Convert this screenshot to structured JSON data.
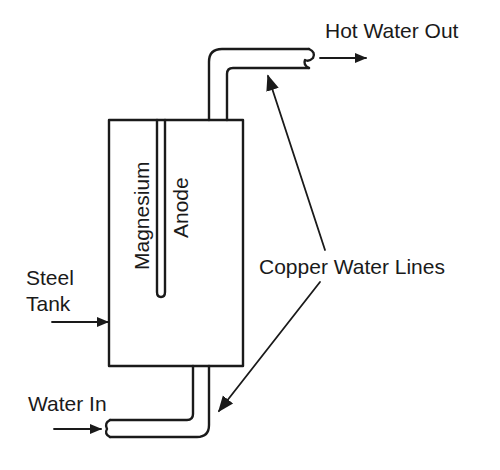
{
  "diagram": {
    "labels": {
      "hot_water_out": "Hot Water Out",
      "copper_water_lines": "Copper Water Lines",
      "steel": "Steel",
      "tank": "Tank",
      "water_in": "Water In",
      "magnesium": "Magnesium",
      "anode": "Anode"
    },
    "components": [
      "steel-tank",
      "magnesium-anode",
      "hot-water-outlet-pipe",
      "cold-water-inlet-pipe"
    ],
    "colors": {
      "line": "#1a1a1a",
      "background": "#ffffff"
    }
  }
}
